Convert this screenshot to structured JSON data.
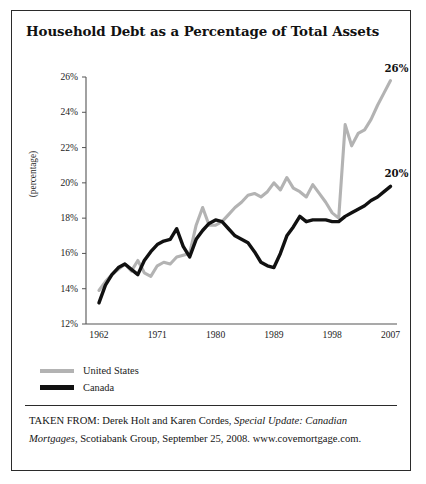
{
  "figure": {
    "title": "Household Debt as a Percentage of Total Assets",
    "source_prefix": "TAKEN FROM: Derek Holt and Karen Cordes, ",
    "source_italic_1": "Special Update:",
    "source_mid": " ",
    "source_italic_2": "Canadian Mortgages",
    "source_suffix": ", Scotiabank Group, September 25, 2008.",
    "source_url": "www.covemortgage.com."
  },
  "legend": {
    "items": [
      {
        "label": "United States",
        "color": "#b3b3b3"
      },
      {
        "label": "Canada",
        "color": "#111111"
      }
    ]
  },
  "chart_data": {
    "type": "line",
    "title": "Household Debt as a Percentage of Total Assets",
    "xlabel": "",
    "ylabel": "(percentage)",
    "xlim": [
      1960,
      2008
    ],
    "ylim": [
      12,
      26
    ],
    "ytick_labels": [
      "26%",
      "24%",
      "22%",
      "20%",
      "18%",
      "16%",
      "14%",
      "12%"
    ],
    "ytick_values": [
      26,
      24,
      22,
      20,
      18,
      16,
      14,
      12
    ],
    "xtick_labels": [
      "1962",
      "1971",
      "1980",
      "1989",
      "1998",
      "2007"
    ],
    "xtick_values": [
      1962,
      1971,
      1980,
      1989,
      1998,
      2007
    ],
    "grid": false,
    "legend_position": "below-left",
    "endpoint_labels": [
      {
        "series": "United States",
        "text": "26%",
        "x": 2007,
        "y": 25.8
      },
      {
        "series": "Canada",
        "text": "20%",
        "x": 2007,
        "y": 19.8
      }
    ],
    "x": [
      1962,
      1963,
      1964,
      1965,
      1966,
      1967,
      1968,
      1969,
      1970,
      1971,
      1972,
      1973,
      1974,
      1975,
      1976,
      1977,
      1978,
      1979,
      1980,
      1981,
      1982,
      1983,
      1984,
      1985,
      1986,
      1987,
      1988,
      1989,
      1990,
      1991,
      1992,
      1993,
      1994,
      1995,
      1996,
      1997,
      1998,
      1999,
      2000,
      2001,
      2002,
      2003,
      2004,
      2005,
      2006,
      2007
    ],
    "series": [
      {
        "name": "United States",
        "color": "#b3b3b3",
        "values": [
          13.9,
          14.4,
          14.8,
          15.1,
          15.4,
          15.0,
          15.6,
          14.9,
          14.7,
          15.3,
          15.5,
          15.4,
          15.8,
          15.9,
          16.0,
          17.6,
          18.6,
          17.6,
          17.6,
          17.8,
          18.2,
          18.6,
          18.9,
          19.3,
          19.4,
          19.2,
          19.5,
          20.0,
          19.6,
          20.3,
          19.7,
          19.5,
          19.2,
          19.9,
          19.4,
          18.9,
          18.3,
          18.0,
          23.3,
          22.1,
          22.8,
          23.0,
          23.6,
          24.4,
          25.1,
          25.8
        ]
      },
      {
        "name": "Canada",
        "color": "#111111",
        "values": [
          13.2,
          14.2,
          14.8,
          15.2,
          15.4,
          15.1,
          14.8,
          15.6,
          16.1,
          16.5,
          16.7,
          16.8,
          17.4,
          16.4,
          15.8,
          16.8,
          17.3,
          17.7,
          17.9,
          17.8,
          17.4,
          17.0,
          16.8,
          16.6,
          16.1,
          15.5,
          15.3,
          15.2,
          16.0,
          17.0,
          17.5,
          18.1,
          17.8,
          17.9,
          17.9,
          17.9,
          17.8,
          17.8,
          18.1,
          18.3,
          18.5,
          18.7,
          19.0,
          19.2,
          19.5,
          19.8
        ]
      }
    ]
  }
}
